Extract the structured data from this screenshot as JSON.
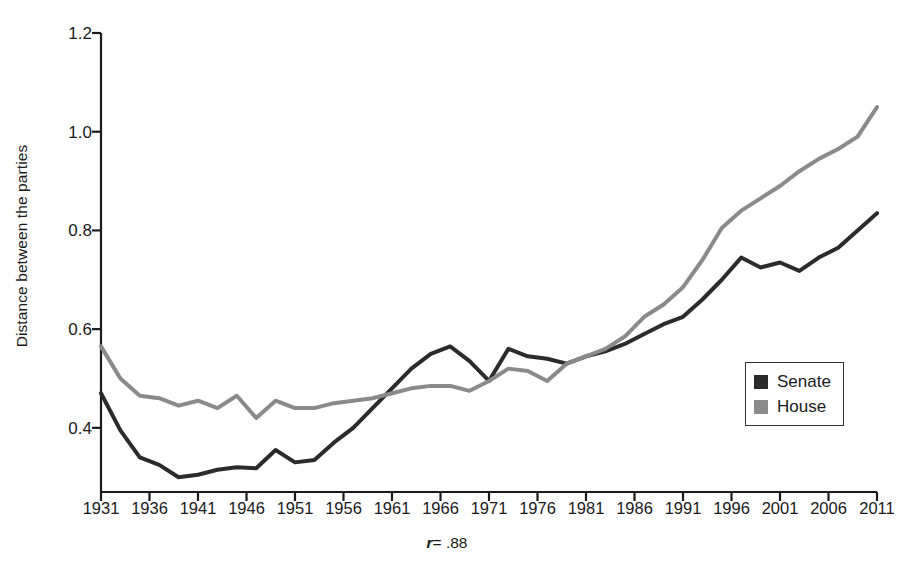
{
  "chart_data": {
    "type": "line",
    "title": "",
    "xlabel": "",
    "ylabel": "Distance between the parties",
    "annotation": "r = .88",
    "annotation_symbol": "r",
    "annotation_value": "= .88",
    "xlim": [
      1931,
      2011
    ],
    "ylim": [
      0.27,
      1.2
    ],
    "grid": false,
    "legend_position": "bottom-right",
    "x_ticks": [
      1931,
      1936,
      1941,
      1946,
      1951,
      1956,
      1961,
      1966,
      1971,
      1976,
      1981,
      1986,
      1991,
      1996,
      2001,
      2006,
      2011
    ],
    "y_ticks": [
      0.4,
      0.6,
      0.8,
      1.0,
      1.2
    ],
    "y_tick_labels": [
      "0.4",
      "0.6",
      "0.8",
      "1.0",
      "1.2"
    ],
    "x": [
      1931,
      1933,
      1935,
      1937,
      1939,
      1941,
      1943,
      1945,
      1947,
      1949,
      1951,
      1953,
      1955,
      1957,
      1959,
      1961,
      1963,
      1965,
      1967,
      1969,
      1971,
      1973,
      1975,
      1977,
      1979,
      1981,
      1983,
      1985,
      1987,
      1989,
      1991,
      1993,
      1995,
      1997,
      1999,
      2001,
      2003,
      2005,
      2007,
      2009,
      2011
    ],
    "series": [
      {
        "name": "Senate",
        "color": "#2b2b2b",
        "values": [
          0.47,
          0.395,
          0.34,
          0.325,
          0.3,
          0.305,
          0.315,
          0.32,
          0.318,
          0.355,
          0.33,
          0.335,
          0.37,
          0.4,
          0.44,
          0.48,
          0.52,
          0.55,
          0.565,
          0.535,
          0.495,
          0.56,
          0.545,
          0.54,
          0.53,
          0.545,
          0.555,
          0.57,
          0.59,
          0.61,
          0.625,
          0.66,
          0.7,
          0.745,
          0.725,
          0.735,
          0.718,
          0.745,
          0.765,
          0.8,
          0.835
        ]
      },
      {
        "name": "House",
        "color": "#8a8a8a",
        "values": [
          0.565,
          0.5,
          0.465,
          0.46,
          0.445,
          0.455,
          0.44,
          0.465,
          0.42,
          0.455,
          0.44,
          0.44,
          0.45,
          0.455,
          0.46,
          0.47,
          0.48,
          0.485,
          0.485,
          0.475,
          0.495,
          0.52,
          0.515,
          0.495,
          0.53,
          0.545,
          0.56,
          0.585,
          0.625,
          0.65,
          0.685,
          0.74,
          0.805,
          0.84,
          0.865,
          0.89,
          0.92,
          0.945,
          0.965,
          0.99,
          1.05
        ]
      }
    ]
  },
  "legend": {
    "items": [
      {
        "label": "Senate",
        "color": "#2b2b2b"
      },
      {
        "label": "House",
        "color": "#8a8a8a"
      }
    ]
  }
}
